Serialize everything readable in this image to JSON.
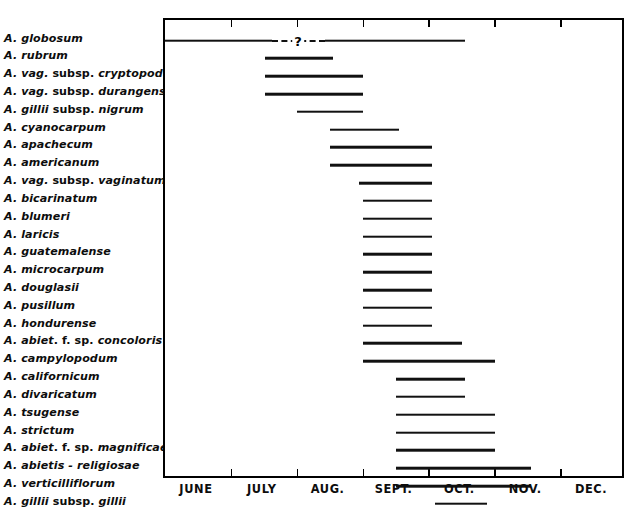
{
  "figure": {
    "type": "gantt-range-chart",
    "frame": {
      "left": 163,
      "top": 18,
      "width": 461,
      "height": 460
    },
    "row_count": 25
  },
  "axis": {
    "months": [
      "JUNE",
      "JULY",
      "AUG.",
      "SEPT.",
      "OCT.",
      "NOV.",
      "DEC."
    ],
    "tick_positions_px": [
      0,
      65.9,
      131.7,
      197.6,
      263.4,
      329.3,
      395.1,
      461
    ],
    "uncertain_marker": "?"
  },
  "chart_data": {
    "type": "bar",
    "title": "",
    "xlabel": "",
    "ylabel": "",
    "orientation": "horizontal-range",
    "x_axis_categories": [
      "JUNE",
      "JULY",
      "AUG.",
      "SEPT.",
      "OCT.",
      "NOV.",
      "DEC."
    ],
    "x_unit": "month",
    "xlim": [
      "JUNE 1",
      "DEC 31"
    ],
    "grid": false,
    "legend": null,
    "note": "Each horizontal line spans the period of the named species; month index 0 = start of JUNE, 7 = end of DEC.",
    "categories": [
      "A. globosum",
      "A. rubrum",
      "A. vag. subsp. cryptopodum",
      "A. vag. subsp. durangense",
      "A. gillii subsp. nigrum",
      "A. cyanocarpum",
      "A. apachecum",
      "A. americanum",
      "A. vag. subsp. vaginatum",
      "A. bicarinatum",
      "A. blumeri",
      "A. laricis",
      "A. guatemalense",
      "A. microcarpum",
      "A. douglasii",
      "A. pusillum",
      "A. hondurense",
      "A. abiet. f. sp. concoloris",
      "A. campylopodum",
      "A. californicum",
      "A. divaricatum",
      "A. tsugense",
      "A. strictum",
      "A. abiet. f. sp. magnificae",
      "A. abietis - religiosae",
      "A. verticilliflorum",
      "A. gillii subsp. gillii",
      "A. occidentale"
    ],
    "ranges_month_index": [
      {
        "species": "A. globosum",
        "start": 0.0,
        "end": 4.55
      },
      {
        "species": "A. rubrum",
        "start": 1.52,
        "end": 2.55
      },
      {
        "species": "A. vag. subsp. cryptopodum",
        "start": 1.52,
        "end": 3.0
      },
      {
        "species": "A. vag. subsp. durangense",
        "start": 1.52,
        "end": 3.0
      },
      {
        "species": "A. gillii subsp. nigrum",
        "start": 2.0,
        "end": 3.0
      },
      {
        "species": "A. cyanocarpum",
        "start": 2.5,
        "end": 3.55
      },
      {
        "species": "A. apachecum",
        "start": 2.5,
        "end": 4.05
      },
      {
        "species": "A. americanum",
        "start": 2.5,
        "end": 4.05
      },
      {
        "species": "A. vag. subsp. vaginatum",
        "start": 2.95,
        "end": 4.05
      },
      {
        "species": "A. bicarinatum",
        "start": 3.0,
        "end": 4.05
      },
      {
        "species": "A. blumeri",
        "start": 3.0,
        "end": 4.05
      },
      {
        "species": "A. laricis",
        "start": 3.0,
        "end": 4.05
      },
      {
        "species": "A. guatemalense",
        "start": 3.0,
        "end": 4.05
      },
      {
        "species": "A. microcarpum",
        "start": 3.0,
        "end": 4.05
      },
      {
        "species": "A. douglasii",
        "start": 3.0,
        "end": 4.05
      },
      {
        "species": "A. pusillum",
        "start": 3.0,
        "end": 4.05
      },
      {
        "species": "A. hondurense",
        "start": 3.0,
        "end": 4.05
      },
      {
        "species": "A. abiet. f. sp. concoloris",
        "start": 3.0,
        "end": 4.5
      },
      {
        "species": "A. campylopodum",
        "start": 3.0,
        "end": 5.0
      },
      {
        "species": "A. californicum",
        "start": 3.5,
        "end": 4.55
      },
      {
        "species": "A. divaricatum",
        "start": 3.5,
        "end": 4.55
      },
      {
        "species": "A. tsugense",
        "start": 3.5,
        "end": 5.0
      },
      {
        "species": "A. strictum",
        "start": 3.5,
        "end": 5.0
      },
      {
        "species": "A. abiet. f. sp. magnificae",
        "start": 3.5,
        "end": 5.0
      },
      {
        "species": "A. abietis - religiosae",
        "start": 3.5,
        "end": 5.55
      },
      {
        "species": "A. verticilliflorum",
        "start": 3.5,
        "end": 5.55
      },
      {
        "species": "A. gillii subsp. gillii",
        "start": 4.1,
        "end": 4.9
      },
      {
        "species": "A. occidentale",
        "start": 4.1,
        "end": 6.1
      }
    ]
  },
  "rows": [
    {
      "label_parts": [
        {
          "t": "A. globosum",
          "i": true
        }
      ],
      "bar": {
        "start": 0,
        "end": 300,
        "dashed_from": 107,
        "dashed_to": 160,
        "qmark_at": 133
      }
    },
    {
      "label_parts": [
        {
          "t": "A. rubrum",
          "i": true
        }
      ],
      "bar": {
        "start": 100,
        "end": 168
      }
    },
    {
      "label_parts": [
        {
          "t": "A. vag.",
          "i": true
        },
        {
          "t": " subsp. ",
          "i": false
        },
        {
          "t": "cryptopodum",
          "i": true
        }
      ],
      "bar": {
        "start": 100,
        "end": 198
      }
    },
    {
      "label_parts": [
        {
          "t": "A. vag.",
          "i": true
        },
        {
          "t": " subsp. ",
          "i": false
        },
        {
          "t": "durangense",
          "i": true
        }
      ],
      "bar": {
        "start": 100,
        "end": 198
      }
    },
    {
      "label_parts": [
        {
          "t": "A. gillii",
          "i": true
        },
        {
          "t": " subsp. ",
          "i": false
        },
        {
          "t": "nigrum",
          "i": true
        }
      ],
      "bar": {
        "start": 132,
        "end": 198
      }
    },
    {
      "label_parts": [
        {
          "t": "A. cyanocarpum",
          "i": true
        }
      ],
      "bar": {
        "start": 165,
        "end": 234
      }
    },
    {
      "label_parts": [
        {
          "t": "A. apachecum",
          "i": true
        }
      ],
      "bar": {
        "start": 165,
        "end": 267
      }
    },
    {
      "label_parts": [
        {
          "t": "A. americanum",
          "i": true
        }
      ],
      "bar": {
        "start": 165,
        "end": 267
      }
    },
    {
      "label_parts": [
        {
          "t": "A. vag.",
          "i": true
        },
        {
          "t": " subsp. ",
          "i": false
        },
        {
          "t": "vaginatum",
          "i": true
        }
      ],
      "bar": {
        "start": 194,
        "end": 267
      }
    },
    {
      "label_parts": [
        {
          "t": "A. bicarinatum",
          "i": true
        }
      ],
      "bar": {
        "start": 198,
        "end": 267
      }
    },
    {
      "label_parts": [
        {
          "t": "A. blumeri",
          "i": true
        }
      ],
      "bar": {
        "start": 198,
        "end": 267
      }
    },
    {
      "label_parts": [
        {
          "t": "A. laricis",
          "i": true
        }
      ],
      "bar": {
        "start": 198,
        "end": 267
      }
    },
    {
      "label_parts": [
        {
          "t": "A. guatemalense",
          "i": true
        }
      ],
      "bar": {
        "start": 198,
        "end": 267
      }
    },
    {
      "label_parts": [
        {
          "t": "A. microcarpum",
          "i": true
        }
      ],
      "bar": {
        "start": 198,
        "end": 267
      }
    },
    {
      "label_parts": [
        {
          "t": "A. douglasii",
          "i": true
        }
      ],
      "bar": {
        "start": 198,
        "end": 267
      }
    },
    {
      "label_parts": [
        {
          "t": "A. pusillum",
          "i": true
        }
      ],
      "bar": {
        "start": 198,
        "end": 267
      }
    },
    {
      "label_parts": [
        {
          "t": "A. hondurense",
          "i": true
        }
      ],
      "bar": {
        "start": 198,
        "end": 267
      }
    },
    {
      "label_parts": [
        {
          "t": "A. abiet",
          "i": true
        },
        {
          "t": ". f. sp. ",
          "i": false
        },
        {
          "t": "concoloris",
          "i": true
        }
      ],
      "bar": {
        "start": 198,
        "end": 297
      }
    },
    {
      "label_parts": [
        {
          "t": "A. campylopodum",
          "i": true
        }
      ],
      "bar": {
        "start": 198,
        "end": 330
      }
    },
    {
      "label_parts": [
        {
          "t": "A. californicum",
          "i": true
        }
      ],
      "bar": {
        "start": 231,
        "end": 300
      }
    },
    {
      "label_parts": [
        {
          "t": "A. divaricatum",
          "i": true
        }
      ],
      "bar": {
        "start": 231,
        "end": 300
      }
    },
    {
      "label_parts": [
        {
          "t": "A. tsugense",
          "i": true
        }
      ],
      "bar": {
        "start": 231,
        "end": 330
      }
    },
    {
      "label_parts": [
        {
          "t": "A. strictum",
          "i": true
        }
      ],
      "bar": {
        "start": 231,
        "end": 330
      }
    },
    {
      "label_parts": [
        {
          "t": "A. abiet",
          "i": true
        },
        {
          "t": ". f. sp. ",
          "i": false
        },
        {
          "t": "magnificae",
          "i": true
        }
      ],
      "bar": {
        "start": 231,
        "end": 330
      }
    },
    {
      "label_parts": [
        {
          "t": "A. abietis - religiosae",
          "i": true
        }
      ],
      "bar": {
        "start": 231,
        "end": 366
      }
    },
    {
      "label_parts": [
        {
          "t": "A. verticilliflorum",
          "i": true
        }
      ],
      "bar": {
        "start": 231,
        "end": 366
      }
    },
    {
      "label_parts": [
        {
          "t": "A. gillii",
          "i": true
        },
        {
          "t": " subsp. ",
          "i": false
        },
        {
          "t": "gillii",
          "i": true
        }
      ],
      "bar": {
        "start": 270,
        "end": 322
      }
    },
    {
      "label_parts": [
        {
          "t": "A. occidentale",
          "i": true
        }
      ],
      "bar": {
        "start": 270,
        "end": 402
      }
    }
  ],
  "colors": {
    "ink": "#111111",
    "frame": "#000000",
    "background": "#ffffff"
  }
}
